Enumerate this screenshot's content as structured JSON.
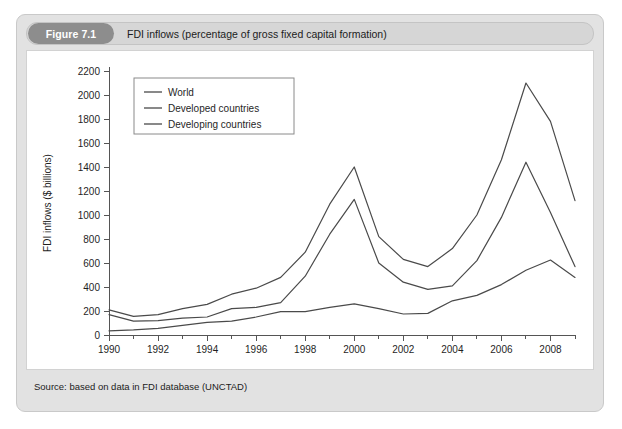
{
  "figure": {
    "badge_label": "Figure 7.1",
    "caption": "FDI inflows (percentage of gross fixed capital formation)",
    "source": "Source: based on data in FDI database (UNCTAD)"
  },
  "colors": {
    "card_background": "#e2e2e2",
    "caption_bar": "#d6d6d6",
    "badge": "#8d8d8d",
    "panel": "#ffffff",
    "line": "#4a4a4a",
    "axis": "#555555"
  },
  "chart_data": {
    "type": "line",
    "title": "FDI inflows (percentage of gross fixed capital formation)",
    "xlabel": "",
    "ylabel": "FDI inflows ($ billions)",
    "xlim": [
      1990,
      2009
    ],
    "ylim": [
      0,
      2200
    ],
    "ytick_step": 200,
    "yticks": [
      0,
      200,
      400,
      600,
      800,
      1000,
      1200,
      1400,
      1600,
      1800,
      2000,
      2200
    ],
    "xticks_major": [
      1990,
      1992,
      1994,
      1996,
      1998,
      2000,
      2002,
      2004,
      2006,
      2008
    ],
    "xticks_minor": [
      1991,
      1993,
      1995,
      1997,
      1999,
      2001,
      2003,
      2005,
      2007,
      2009
    ],
    "grid": false,
    "legend_position": "upper-left",
    "x": [
      1990,
      1991,
      1992,
      1993,
      1994,
      1995,
      1996,
      1997,
      1998,
      1999,
      2000,
      2001,
      2002,
      2003,
      2004,
      2005,
      2006,
      2007,
      2008,
      2009
    ],
    "series": [
      {
        "name": "World",
        "values": [
          210,
          155,
          170,
          220,
          255,
          340,
          390,
          480,
          690,
          1090,
          1400,
          820,
          630,
          570,
          720,
          1000,
          1460,
          2100,
          1780,
          1120
        ]
      },
      {
        "name": "Developed countries",
        "values": [
          170,
          115,
          120,
          140,
          150,
          220,
          230,
          270,
          490,
          840,
          1130,
          600,
          440,
          380,
          410,
          620,
          980,
          1440,
          1020,
          570
        ]
      },
      {
        "name": "Developing countries",
        "values": [
          35,
          42,
          55,
          80,
          105,
          115,
          150,
          195,
          195,
          230,
          260,
          220,
          175,
          180,
          285,
          330,
          420,
          540,
          625,
          480
        ]
      }
    ]
  }
}
